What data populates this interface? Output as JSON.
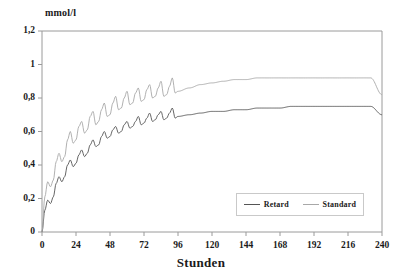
{
  "chart_data": {
    "type": "line",
    "title": "",
    "xlabel": "Stunden",
    "ylabel": "mmol/l",
    "xlim": [
      0,
      240
    ],
    "ylim": [
      0,
      1.2
    ],
    "grid": false,
    "legend_position": "bottom-right",
    "xticks": [
      "0",
      "24",
      "48",
      "72",
      "96",
      "120",
      "144",
      "168",
      "192",
      "216",
      "240"
    ],
    "xtick_values": [
      0,
      24,
      48,
      72,
      96,
      120,
      144,
      168,
      192,
      216,
      240
    ],
    "yticks": [
      "0",
      "0,2",
      "0,4",
      "0,6",
      "0,8",
      "1",
      "1,2"
    ],
    "ytick_values": [
      0,
      0.2,
      0.4,
      0.6,
      0.8,
      1.0,
      1.2
    ],
    "dose_interval_hours": 8,
    "series": [
      {
        "name": "Retard",
        "color": "#555555",
        "steady_state_peak": 0.79,
        "steady_state_trough": 0.68,
        "x": [
          0,
          2,
          4,
          6,
          8,
          10,
          12,
          14,
          16,
          18,
          20,
          22,
          24,
          26,
          28,
          30,
          32,
          34,
          36,
          38,
          40,
          42,
          44,
          46,
          48,
          50,
          52,
          54,
          56,
          58,
          60,
          62,
          64,
          66,
          68,
          70,
          72,
          74,
          76,
          78,
          80,
          82,
          84,
          86,
          88,
          90,
          92,
          94,
          96,
          104,
          112,
          120,
          128,
          136,
          144,
          152,
          160,
          168,
          176,
          184,
          192,
          200,
          208,
          216,
          224,
          232,
          240
        ],
        "values": [
          0,
          0.13,
          0.19,
          0.17,
          0.21,
          0.29,
          0.33,
          0.3,
          0.33,
          0.4,
          0.43,
          0.39,
          0.41,
          0.46,
          0.49,
          0.45,
          0.47,
          0.52,
          0.55,
          0.51,
          0.52,
          0.57,
          0.6,
          0.56,
          0.57,
          0.61,
          0.63,
          0.59,
          0.6,
          0.64,
          0.66,
          0.62,
          0.63,
          0.66,
          0.69,
          0.64,
          0.65,
          0.68,
          0.71,
          0.66,
          0.67,
          0.7,
          0.72,
          0.67,
          0.68,
          0.71,
          0.74,
          0.68,
          0.69,
          0.7,
          0.71,
          0.72,
          0.72,
          0.73,
          0.73,
          0.74,
          0.74,
          0.74,
          0.75,
          0.75,
          0.75,
          0.75,
          0.75,
          0.75,
          0.75,
          0.75,
          0.7
        ]
      },
      {
        "name": "Standard",
        "color": "#a8a8a8",
        "steady_state_peak": 1.0,
        "steady_state_trough": 0.84,
        "x": [
          0,
          2,
          4,
          6,
          8,
          10,
          12,
          14,
          16,
          18,
          20,
          22,
          24,
          26,
          28,
          30,
          32,
          34,
          36,
          38,
          40,
          42,
          44,
          46,
          48,
          50,
          52,
          54,
          56,
          58,
          60,
          62,
          64,
          66,
          68,
          70,
          72,
          74,
          76,
          78,
          80,
          82,
          84,
          86,
          88,
          90,
          92,
          94,
          96,
          104,
          112,
          120,
          128,
          136,
          144,
          152,
          160,
          168,
          176,
          184,
          192,
          200,
          208,
          216,
          224,
          232,
          240
        ],
        "values": [
          0,
          0.21,
          0.3,
          0.27,
          0.31,
          0.42,
          0.47,
          0.42,
          0.45,
          0.55,
          0.6,
          0.53,
          0.55,
          0.63,
          0.66,
          0.59,
          0.61,
          0.69,
          0.72,
          0.64,
          0.66,
          0.73,
          0.77,
          0.69,
          0.7,
          0.77,
          0.81,
          0.73,
          0.74,
          0.8,
          0.84,
          0.76,
          0.77,
          0.83,
          0.86,
          0.78,
          0.79,
          0.85,
          0.88,
          0.8,
          0.81,
          0.86,
          0.9,
          0.81,
          0.82,
          0.87,
          0.92,
          0.83,
          0.84,
          0.86,
          0.88,
          0.89,
          0.9,
          0.91,
          0.91,
          0.92,
          0.92,
          0.92,
          0.92,
          0.92,
          0.92,
          0.92,
          0.92,
          0.92,
          0.92,
          0.92,
          0.82
        ]
      }
    ]
  },
  "axes": {
    "y_unit_label": "mmol/l",
    "x_axis_title": "Stunden"
  },
  "legend": {
    "items": [
      {
        "label": "Retard",
        "color": "#555555"
      },
      {
        "label": "Standard",
        "color": "#a8a8a8"
      }
    ]
  },
  "colors": {
    "retard": "#555555",
    "standard": "#a8a8a8",
    "axis": "#9a9a9a",
    "text": "#1a1a1a",
    "background": "#ffffff"
  }
}
